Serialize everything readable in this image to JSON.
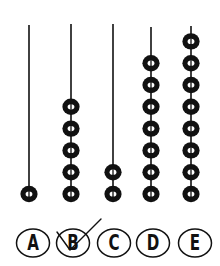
{
  "figure": {
    "type": "abacus",
    "rods": [
      {
        "label": "A",
        "beads": 1,
        "x": 29,
        "top": 25
      },
      {
        "label": "B",
        "beads": 5,
        "x": 71,
        "top": 24
      },
      {
        "label": "C",
        "beads": 2,
        "x": 113,
        "top": 24
      },
      {
        "label": "D",
        "beads": 7,
        "x": 151,
        "top": 27
      },
      {
        "label": "E",
        "beads": 8,
        "x": 191,
        "top": 26
      }
    ],
    "bead_bottom_y": 194,
    "bead_pitch": 21.8
  },
  "answers": {
    "options": [
      {
        "label": "A",
        "cx": 33,
        "selected": false
      },
      {
        "label": "B",
        "cx": 73,
        "selected": true
      },
      {
        "label": "C",
        "cx": 114,
        "selected": false
      },
      {
        "label": "D",
        "cx": 153,
        "selected": false
      },
      {
        "label": "E",
        "cx": 195,
        "selected": false
      }
    ],
    "cy": 243,
    "check_mark_on": "B"
  },
  "colors": {
    "ink": "#111111",
    "background": "#ffffff"
  }
}
